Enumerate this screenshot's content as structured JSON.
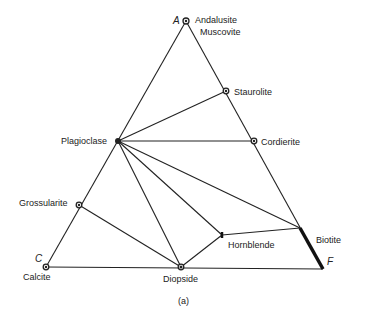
{
  "diagram": {
    "type": "ternary ACF diagram",
    "vertices": {
      "A": {
        "label": "A",
        "x": 186,
        "y": 21
      },
      "C": {
        "label": "C",
        "x": 46,
        "y": 267
      },
      "F": {
        "label": "F",
        "x": 323,
        "y": 269
      }
    },
    "phases": [
      {
        "id": "andalusite",
        "label": "Andalusite",
        "x": 186,
        "y": 21
      },
      {
        "id": "muscovite",
        "label": "Muscovite",
        "x": 186,
        "y": 21
      },
      {
        "id": "staurolite",
        "label": "Staurolite",
        "x": 226,
        "y": 91
      },
      {
        "id": "cordierite",
        "label": "Cordierite",
        "x": 254,
        "y": 141
      },
      {
        "id": "plagioclase",
        "label": "Plagioclase",
        "x": 118,
        "y": 141
      },
      {
        "id": "grossularite",
        "label": "Grossularite",
        "x": 79,
        "y": 205
      },
      {
        "id": "calcite",
        "label": "Calcite",
        "x": 46,
        "y": 267
      },
      {
        "id": "diopside",
        "label": "Diopside",
        "x": 181,
        "y": 267
      },
      {
        "id": "hornblende",
        "label": "Hornblende",
        "x": 222,
        "y": 235
      },
      {
        "id": "biotite",
        "label": "Biotite",
        "x": 300,
        "y": 228
      }
    ],
    "caption": "(a)"
  }
}
